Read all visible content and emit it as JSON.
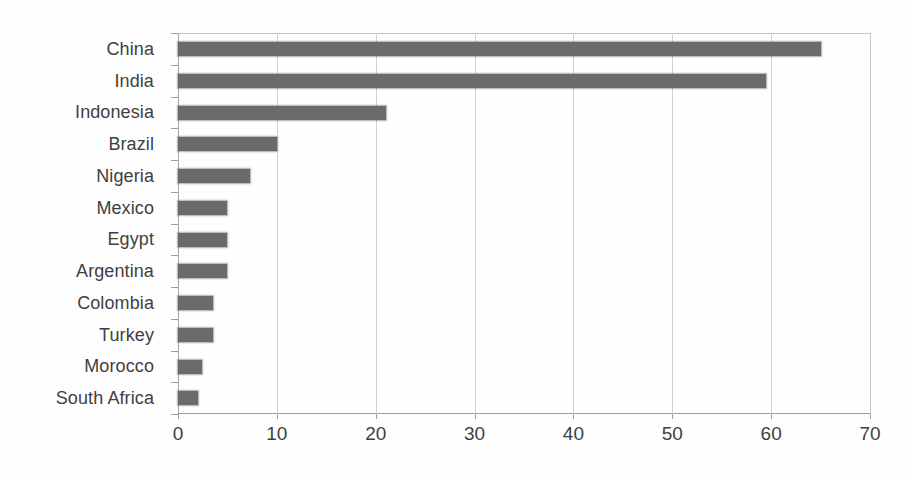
{
  "chart_data": {
    "type": "bar",
    "orientation": "horizontal",
    "title": "",
    "subtitle": "",
    "xlabel": "",
    "ylabel": "",
    "xlim": [
      0,
      70
    ],
    "ylim": null,
    "grid": true,
    "legend": null,
    "legend_position": "none",
    "xticks": [
      "0",
      "10",
      "20",
      "30",
      "40",
      "50",
      "60",
      "70"
    ],
    "xtick_values": [
      0,
      10,
      20,
      30,
      40,
      50,
      60,
      70
    ],
    "xtick_step": 10,
    "categories": [
      "China",
      "India",
      "Indonesia",
      "Brazil",
      "Nigeria",
      "Mexico",
      "Egypt",
      "Argentina",
      "Colombia",
      "Turkey",
      "Morocco",
      "South Africa"
    ],
    "values": [
      65,
      59.5,
      21,
      10,
      7.3,
      5,
      5,
      5,
      3.5,
      3.5,
      2.4,
      2
    ],
    "bar_color": "#6b6b6b",
    "background_color": "#ffffff",
    "gridline_color": "#d2d2d2",
    "axis_color": "#9d9d9d",
    "text_color": "#3f3f3f"
  }
}
